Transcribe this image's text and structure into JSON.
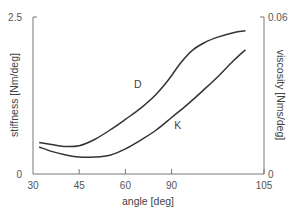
{
  "chart_data": {
    "type": "line",
    "title": "",
    "xlabel": "angle [deg]",
    "ylabel": "stiffness [Nm/deg]",
    "y2label": "viscosity [Nms/deg]",
    "xlim": [
      30,
      105
    ],
    "ylim": [
      0,
      2.5
    ],
    "y2lim": [
      0,
      0.06
    ],
    "x_ticks": [
      30,
      45,
      60,
      75,
      105
    ],
    "x_tick_labels": [
      "30",
      "45",
      "60",
      "90",
      "105"
    ],
    "y_tick_labels": [
      "0",
      "2.5"
    ],
    "y2_tick_labels": [
      "0",
      "0.06"
    ],
    "grid": false,
    "legend": "inline labels",
    "series": [
      {
        "name": "D",
        "axis": "left",
        "x": [
          32,
          36,
          40,
          45,
          50,
          55,
          60,
          65,
          70,
          74,
          78,
          82,
          86,
          90,
          95,
          99
        ],
        "values": [
          0.5,
          0.47,
          0.44,
          0.45,
          0.55,
          0.7,
          0.87,
          1.05,
          1.27,
          1.5,
          1.77,
          1.98,
          2.1,
          2.18,
          2.25,
          2.28
        ]
      },
      {
        "name": "K",
        "axis": "left",
        "x": [
          32,
          36,
          40,
          45,
          50,
          55,
          60,
          65,
          70,
          75,
          80,
          85,
          90,
          95,
          99
        ],
        "values": [
          0.43,
          0.36,
          0.31,
          0.27,
          0.27,
          0.3,
          0.4,
          0.54,
          0.7,
          0.9,
          1.1,
          1.32,
          1.55,
          1.8,
          1.98
        ]
      }
    ],
    "annotations": [
      {
        "text": "D",
        "x": 64,
        "y": 1.37
      },
      {
        "text": "K",
        "x": 77,
        "y": 0.72
      }
    ]
  }
}
